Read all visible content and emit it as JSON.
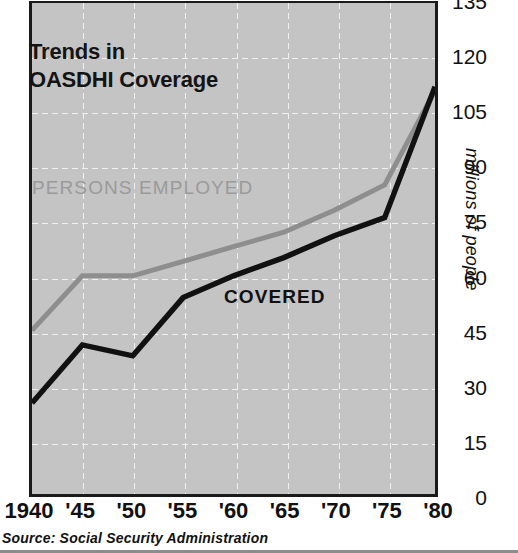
{
  "figure": {
    "title": "Trends in\nOASDHI Coverage",
    "source": "Source:  Social Security Administration",
    "background_color": "#c4c4c4",
    "gridline_color": "#f2f2f2",
    "frame_color": "#1a1a1a"
  },
  "labels": {
    "persons_employed": "PERSONS EMPLOYED",
    "covered": "COVERED",
    "y_axis_title": "millions of people"
  },
  "chart_data": {
    "type": "line",
    "title": "Trends in OASDHI Coverage",
    "subtitle": "",
    "xlabel": "",
    "ylabel": "millions of people",
    "x": [
      1940,
      1945,
      1950,
      1955,
      1960,
      1965,
      1970,
      1975,
      1980
    ],
    "categories": [
      "1940",
      "'45",
      "'50",
      "'55",
      "'60",
      "'65",
      "'70",
      "'75",
      "'80"
    ],
    "xlim": [
      1940,
      1980
    ],
    "ylim": [
      0,
      135
    ],
    "yticks": [
      0,
      15,
      30,
      45,
      60,
      75,
      90,
      105,
      120,
      135
    ],
    "ytick_labels": [
      "0",
      "15",
      "30",
      "45",
      "60",
      "75",
      "90",
      "105",
      "120",
      "135"
    ],
    "grid": true,
    "legend": "inline-annotations",
    "series": [
      {
        "name": "PERSONS EMPLOYED",
        "color": "#8e8e8e",
        "values": [
          45,
          60,
          60,
          64,
          68,
          72,
          78,
          85,
          111
        ]
      },
      {
        "name": "COVERED",
        "color": "#111111",
        "values": [
          25,
          41,
          38,
          54,
          60,
          65,
          71,
          76,
          112
        ]
      }
    ],
    "annotations": [
      {
        "text": "PERSONS EMPLOYED",
        "x": 1940.6,
        "y": 89,
        "color": "#9a9a9a"
      },
      {
        "text": "COVERED",
        "x": 1959,
        "y": 57,
        "color": "#111111"
      }
    ]
  }
}
